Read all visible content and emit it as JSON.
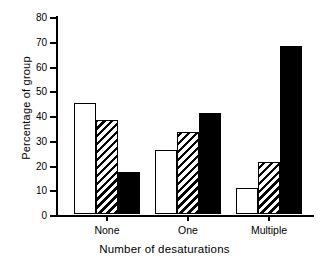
{
  "chart_data": {
    "type": "bar",
    "title": "",
    "xlabel": "Number of desaturations",
    "ylabel": "Percentage of group",
    "categories": [
      "None",
      "One",
      "Multiple"
    ],
    "series": [
      {
        "name": "white",
        "fill": "open",
        "values": [
          45,
          26,
          10.5
        ]
      },
      {
        "name": "hatched",
        "fill": "hatch",
        "values": [
          38,
          33,
          21
        ]
      },
      {
        "name": "black",
        "fill": "solid",
        "values": [
          17,
          41,
          68
        ]
      }
    ],
    "ylim": [
      0,
      80
    ],
    "yticks": [
      0,
      10,
      20,
      30,
      40,
      50,
      60,
      70,
      80
    ],
    "ytick_labels": [
      "0",
      "10",
      "20",
      "30",
      "40",
      "50",
      "60",
      "70",
      "80"
    ],
    "grid": false,
    "legend": "none",
    "colors": {
      "axis": "#000000",
      "bar_open": "#ffffff",
      "bar_solid": "#000000",
      "bar_edge": "#000000",
      "background": "#ffffff"
    }
  }
}
